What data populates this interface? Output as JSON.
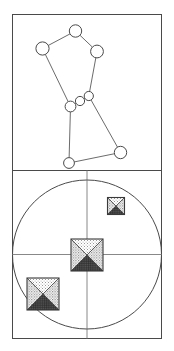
{
  "figure": {
    "title": "",
    "width": 174,
    "height": 351,
    "background_color": "#ffffff",
    "stroke_color": "#4a4a4a",
    "frame": {
      "x": 12,
      "y": 14,
      "width": 150,
      "height": 325
    },
    "divider_y": 170
  },
  "panels": [
    {
      "id": "upper-panel",
      "name": "node-link-graph-panel",
      "type": "graph",
      "bounds": {
        "x": 12,
        "y": 14,
        "width": 150,
        "height": 156
      },
      "node_fill": "#ffffff",
      "node_stroke": "#4a4a4a",
      "edge_stroke": "#5a5a5a",
      "nodes": [
        {
          "id": "n1",
          "label": "",
          "cx": 75.5,
          "cy": 31.0,
          "r": 6.2
        },
        {
          "id": "n2",
          "label": "",
          "cx": 42.5,
          "cy": 48.5,
          "r": 6.6
        },
        {
          "id": "n3",
          "label": "",
          "cx": 97.0,
          "cy": 51.5,
          "r": 6.4
        },
        {
          "id": "n4",
          "label": "",
          "cx": 88.8,
          "cy": 96.0,
          "r": 4.6
        },
        {
          "id": "n5",
          "label": "",
          "cx": 80.0,
          "cy": 101.0,
          "r": 4.6
        },
        {
          "id": "n6",
          "label": "",
          "cx": 70.5,
          "cy": 106.5,
          "r": 5.4
        },
        {
          "id": "n7",
          "label": "",
          "cx": 69.0,
          "cy": 163.0,
          "r": 5.4
        },
        {
          "id": "n8",
          "label": "",
          "cx": 120.5,
          "cy": 152.5,
          "r": 6.2
        }
      ],
      "edges": [
        {
          "from": "n2",
          "to": "n1"
        },
        {
          "from": "n1",
          "to": "n3"
        },
        {
          "from": "n2",
          "to": "n6"
        },
        {
          "from": "n3",
          "to": "n4"
        },
        {
          "from": "n6",
          "to": "n5"
        },
        {
          "from": "n5",
          "to": "n4"
        },
        {
          "from": "n6",
          "to": "n7"
        },
        {
          "from": "n4",
          "to": "n8"
        },
        {
          "from": "n7",
          "to": "n8"
        }
      ]
    },
    {
      "id": "lower-panel",
      "name": "circle-marker-panel",
      "type": "scatter",
      "bounds": {
        "x": 12,
        "y": 170,
        "width": 150,
        "height": 169
      },
      "circle": {
        "cx": 87.0,
        "cy": 254.5,
        "r": 74.5,
        "stroke": "#4a4a4a"
      },
      "crosshair": {
        "vertical_x": 87.0,
        "horizontal_y": 254.5,
        "stroke": "#6a6a6a"
      },
      "markers": [
        {
          "id": "m1",
          "label": "",
          "cx": 116.0,
          "cy": 206.0,
          "size": 17
        },
        {
          "id": "m2",
          "label": "",
          "cx": 87.0,
          "cy": 255.0,
          "size": 32
        },
        {
          "id": "m3",
          "label": "",
          "cx": 43.0,
          "cy": 294.0,
          "size": 32
        }
      ],
      "marker_style": {
        "outline": "#3a3a3a",
        "top_fill": "#e6e6e6",
        "left_fill": "#d2d2d2",
        "right_fill": "#dcdcdc",
        "bottom_fill": "#4a4a4a"
      }
    }
  ]
}
